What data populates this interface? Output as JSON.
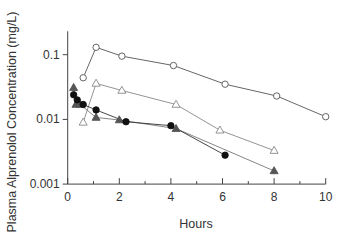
{
  "chart_data": {
    "type": "line",
    "title": "",
    "xlabel": "Hours",
    "ylabel": "Plasma Alprenolol Concentration (mg/L)",
    "xscale": "linear",
    "yscale": "log",
    "xlim": [
      0,
      10
    ],
    "ylim": [
      0.001,
      0.2
    ],
    "xticks": [
      0,
      2,
      4,
      6,
      8,
      10
    ],
    "xtick_labels": [
      "0",
      "2",
      "4",
      "6",
      "8",
      "10"
    ],
    "x_minor_ticks": [
      1,
      3,
      5,
      7,
      9
    ],
    "yticks": [
      0.001,
      0.01,
      0.1
    ],
    "ytick_labels": [
      "0.001",
      "0.01",
      "0.1"
    ],
    "grid": false,
    "legend": null,
    "series": [
      {
        "name": "open-circle",
        "marker": "circle",
        "filled": false,
        "marker_color": "#555555",
        "line_color": "#555555",
        "x": [
          0.6,
          1.1,
          2.1,
          4.1,
          6.1,
          8.1,
          10.0
        ],
        "y": [
          0.044,
          0.13,
          0.095,
          0.068,
          0.035,
          0.023,
          0.011
        ]
      },
      {
        "name": "open-triangle",
        "marker": "triangle",
        "filled": false,
        "marker_color": "#888888",
        "line_color": "#888888",
        "x": [
          0.6,
          1.1,
          2.1,
          4.2,
          5.9,
          8.0
        ],
        "y": [
          0.009,
          0.036,
          0.028,
          0.017,
          0.0068,
          0.0033
        ]
      },
      {
        "name": "filled-triangle",
        "marker": "triangle",
        "filled": true,
        "marker_color": "#555555",
        "line_color": "#777777",
        "x": [
          0.23,
          0.32,
          0.48,
          1.1,
          2.0,
          4.2,
          8.0
        ],
        "y": [
          0.031,
          0.017,
          0.017,
          0.0107,
          0.0098,
          0.0072,
          0.0016
        ]
      },
      {
        "name": "filled-circle",
        "marker": "circle",
        "filled": true,
        "marker_color": "#111111",
        "line_color": "#333333",
        "x": [
          0.23,
          0.37,
          0.6,
          1.1,
          2.26,
          4.0,
          6.1
        ],
        "y": [
          0.024,
          0.02,
          0.017,
          0.014,
          0.0092,
          0.008,
          0.0028
        ]
      }
    ]
  }
}
